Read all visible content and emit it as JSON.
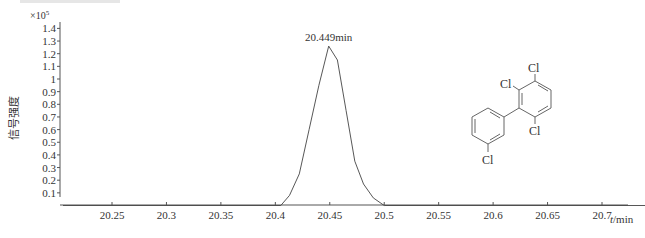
{
  "chart_data": {
    "type": "line",
    "title": "",
    "xlabel": "t/min",
    "xlabel_italic_part": "t",
    "xlabel_unit_part": "/min",
    "ylabel": "信号强度",
    "y_multiplier": "×10",
    "y_multiplier_exp": "5",
    "xlim": [
      20.205,
      20.74
    ],
    "ylim": [
      0,
      1.45
    ],
    "x_ticks": [
      20.25,
      20.3,
      20.35,
      20.4,
      20.45,
      20.5,
      20.55,
      20.6,
      20.65,
      20.7
    ],
    "x_tick_labels": [
      "20.25",
      "20.3",
      "20.35",
      "20.4",
      "20.45",
      "20.5",
      "20.55",
      "20.6",
      "20.65",
      "20.7"
    ],
    "y_ticks": [
      0.1,
      0.2,
      0.3,
      0.4,
      0.5,
      0.6,
      0.7,
      0.8,
      0.9,
      1.0,
      1.1,
      1.2,
      1.3,
      1.4
    ],
    "y_tick_labels": [
      "0.1",
      "0.2",
      "0.3",
      "0.4",
      "0.5",
      "0.6",
      "0.7",
      "0.8",
      "0.9",
      "1",
      "1.1",
      "1.2",
      "1.3",
      "1.4"
    ],
    "grid": false,
    "legend": null,
    "series": [
      {
        "name": "chromatogram",
        "x": [
          20.205,
          20.405,
          20.413,
          20.422,
          20.431,
          20.44,
          20.449,
          20.457,
          20.465,
          20.473,
          20.481,
          20.49,
          20.5,
          20.74
        ],
        "values": [
          0,
          0,
          0.08,
          0.25,
          0.6,
          0.95,
          1.26,
          1.15,
          0.75,
          0.35,
          0.17,
          0.06,
          0,
          0
        ]
      }
    ],
    "annotations": [
      {
        "text": "20.449min",
        "x": 20.449,
        "y": 1.26
      }
    ],
    "inset": {
      "type": "chemical-structure",
      "compound": "2,3,3',6-tetrachlorobiphenyl",
      "atom_labels": [
        "Cl",
        "Cl",
        "Cl",
        "Cl"
      ]
    }
  }
}
